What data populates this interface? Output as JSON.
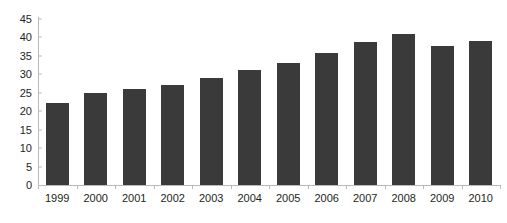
{
  "chart_data": {
    "type": "bar",
    "title": "",
    "subtitle": "",
    "xlabel": "",
    "ylabel": "",
    "categories": [
      "1999",
      "2000",
      "2001",
      "2002",
      "2003",
      "2004",
      "2005",
      "2006",
      "2007",
      "2008",
      "2009",
      "2010"
    ],
    "values": [
      22.3,
      25.0,
      26.0,
      27.2,
      29.0,
      31.2,
      33.2,
      35.8,
      38.8,
      41.0,
      37.6,
      39.0
    ],
    "ylim": [
      0,
      45
    ],
    "ytick_labels": [
      "0",
      "5",
      "10",
      "15",
      "20",
      "25",
      "30",
      "35",
      "40",
      "45"
    ],
    "ytick_values": [
      0,
      5,
      10,
      15,
      20,
      25,
      30,
      35,
      40,
      45
    ],
    "grid": false,
    "legend": null,
    "legend_position": "none",
    "annotations": [],
    "colors": {
      "bar": "#3a3a3a",
      "axis": "#b9b9b9",
      "text": "#231f20",
      "background": "#ffffff"
    }
  }
}
